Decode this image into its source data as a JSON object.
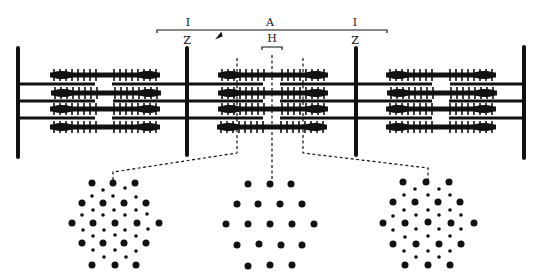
{
  "diagram": {
    "labels": {
      "i_band_left": "I",
      "a_band": "A",
      "i_band_right": "I",
      "z_line_left": "Z",
      "h_zone": "H",
      "z_line_right": "Z"
    },
    "colors": {
      "ink": "#111111",
      "background": "#ffffff"
    },
    "cross_sections": [
      {
        "name": "overlap-region-left",
        "description": "thick + thin filaments (hexagonal lattice)"
      },
      {
        "name": "h-zone",
        "description": "thick filaments only"
      },
      {
        "name": "overlap-region-right",
        "description": "thick + thin filaments (hexagonal lattice)"
      }
    ]
  }
}
